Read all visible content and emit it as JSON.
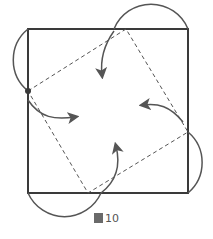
{
  "caption": {
    "glyph": "圖",
    "number": "10"
  },
  "colors": {
    "stroke": "#3a3a3a",
    "arrow": "#555555",
    "dash": "#555555"
  },
  "shapes": {
    "outer_square": {
      "x": 28,
      "y": 29,
      "w": 160,
      "h": 164
    },
    "inner_dashed_square": [
      [
        28,
        91
      ],
      [
        126,
        29
      ],
      [
        188,
        132
      ],
      [
        88,
        193
      ]
    ],
    "pivot_dot": [
      28,
      91
    ]
  }
}
